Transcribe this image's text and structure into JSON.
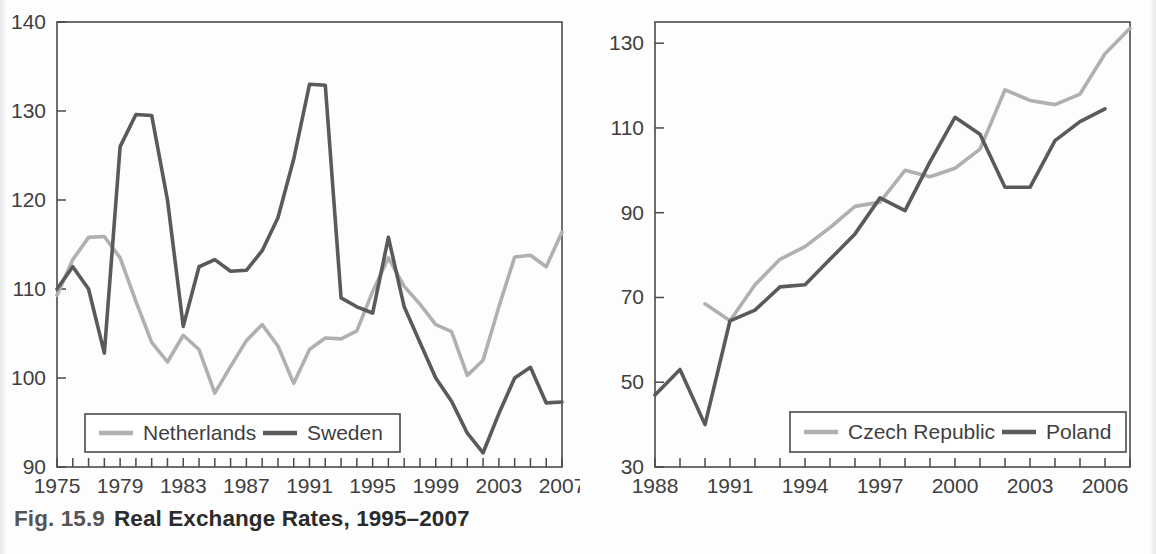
{
  "caption": {
    "number": "Fig. 15.9",
    "title": "Real Exchange Rates, 1995–2007"
  },
  "colors": {
    "light_series": "#b0b0b0",
    "dark_series": "#5a5a5a",
    "axis": "#4a4a4a",
    "text": "#3f3f3f"
  },
  "chart_data": [
    {
      "type": "line",
      "panel": "left",
      "title": "",
      "xlabel": "",
      "ylabel": "",
      "xlim": [
        1975,
        2007
      ],
      "ylim": [
        90,
        140
      ],
      "grid": false,
      "legend_position": "bottom-left",
      "ytick_labels": [
        "140",
        "130",
        "120",
        "110",
        "100",
        "90"
      ],
      "yticks": [
        140,
        130,
        120,
        110,
        100,
        90
      ],
      "xtick_labels": [
        "1975",
        "1979",
        "1983",
        "1987",
        "1991",
        "1995",
        "1999",
        "2003",
        "2007"
      ],
      "xticks": [
        1975,
        1979,
        1983,
        1987,
        1991,
        1995,
        1999,
        2003,
        2007
      ],
      "x": [
        1975,
        1976,
        1977,
        1978,
        1979,
        1980,
        1981,
        1982,
        1983,
        1984,
        1985,
        1986,
        1987,
        1988,
        1989,
        1990,
        1991,
        1992,
        1993,
        1994,
        1995,
        1996,
        1997,
        1998,
        1999,
        2000,
        2001,
        2002,
        2003,
        2004,
        2005,
        2006,
        2007
      ],
      "series": [
        {
          "name": "Netherlands",
          "color": "#b0b0b0",
          "values": [
            109.3,
            113.3,
            115.8,
            115.9,
            113.5,
            108.6,
            104.0,
            101.8,
            104.8,
            103.2,
            98.3,
            101.3,
            104.2,
            106.0,
            103.6,
            99.4,
            103.2,
            104.5,
            104.4,
            105.3,
            109.7,
            113.5,
            110.3,
            108.3,
            106.0,
            105.2,
            100.3,
            102.0,
            108.0,
            113.6,
            113.8,
            112.5,
            116.4
          ]
        },
        {
          "name": "Sweden",
          "color": "#5a5a5a",
          "values": [
            110.0,
            112.5,
            110.0,
            102.8,
            126.0,
            129.6,
            129.5,
            120.0,
            105.8,
            112.5,
            113.3,
            112.0,
            112.1,
            114.3,
            118.0,
            124.6,
            133.0,
            132.9,
            109.0,
            108.0,
            107.3,
            115.8,
            108.0,
            104.0,
            100.0,
            97.4,
            93.8,
            91.6,
            96.0,
            100.0,
            101.2,
            97.2,
            97.3
          ]
        }
      ]
    },
    {
      "type": "line",
      "panel": "right",
      "title": "",
      "xlabel": "",
      "ylabel": "",
      "xlim": [
        1988,
        2007
      ],
      "ylim": [
        30,
        135
      ],
      "grid": false,
      "legend_position": "bottom-right",
      "ytick_labels": [
        "130",
        "110",
        "90",
        "70",
        "50",
        "30"
      ],
      "yticks": [
        130,
        110,
        90,
        70,
        50,
        30
      ],
      "xtick_labels": [
        "1988",
        "1991",
        "1994",
        "1997",
        "2000",
        "2003",
        "2006"
      ],
      "xticks": [
        1988,
        1991,
        1994,
        1997,
        2000,
        2003,
        2006
      ],
      "x": [
        1988,
        1989,
        1990,
        1991,
        1992,
        1993,
        1994,
        1995,
        1996,
        1997,
        1998,
        1999,
        2000,
        2001,
        2002,
        2003,
        2004,
        2005,
        2006,
        2007
      ],
      "series": [
        {
          "name": "Czech Republic",
          "color": "#b0b0b0",
          "values": [
            null,
            null,
            68.5,
            64.5,
            73.0,
            79.0,
            82.0,
            86.5,
            91.5,
            92.5,
            100.0,
            98.5,
            100.5,
            105.0,
            119.0,
            116.5,
            115.5,
            118.0,
            127.5,
            133.5,
            null
          ]
        },
        {
          "name": "Poland",
          "color": "#5a5a5a",
          "values": [
            47.0,
            53.0,
            40.0,
            64.5,
            67.0,
            72.5,
            73.0,
            79.0,
            85.0,
            93.5,
            90.5,
            102.0,
            112.5,
            108.5,
            96.0,
            96.0,
            107.0,
            111.5,
            114.5,
            null
          ]
        }
      ]
    }
  ],
  "left_legend": {
    "entries": [
      {
        "label": "Netherlands",
        "color": "#b0b0b0"
      },
      {
        "label": "Sweden",
        "color": "#5a5a5a"
      }
    ]
  },
  "right_legend": {
    "entries": [
      {
        "label": "Czech Republic",
        "color": "#b0b0b0"
      },
      {
        "label": "Poland",
        "color": "#5a5a5a"
      }
    ]
  }
}
